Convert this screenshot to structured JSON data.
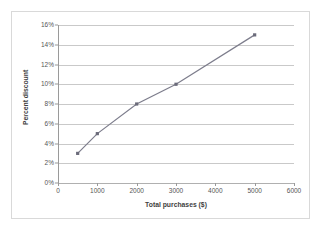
{
  "chart_data": {
    "type": "line",
    "title": "",
    "xlabel": "Total purchases ($)",
    "ylabel": "Percent discount",
    "x": [
      500,
      1000,
      2000,
      3000,
      5000
    ],
    "values": [
      3,
      5,
      8,
      10,
      15
    ],
    "point_labels": [
      "3%",
      "5%",
      "8%",
      "10%",
      "15%"
    ],
    "xlim": [
      0,
      6000
    ],
    "ylim": [
      0,
      16
    ],
    "xticks": [
      0,
      1000,
      2000,
      3000,
      4000,
      5000,
      6000
    ],
    "xtick_labels": [
      "0",
      "1000",
      "2000",
      "3000",
      "4000",
      "5000",
      "6000"
    ],
    "yticks": [
      0,
      2,
      4,
      6,
      8,
      10,
      12,
      14,
      16
    ],
    "ytick_labels": [
      "0%",
      "2%",
      "4%",
      "6%",
      "8%",
      "10%",
      "12%",
      "14%",
      "16%"
    ],
    "grid": "horizontal",
    "legend": "none",
    "series": [
      {
        "name": "Percent discount",
        "values": [
          3,
          5,
          8,
          10,
          15
        ],
        "marker": "square",
        "line_color": "#7d7d8c",
        "marker_color": "#6b6b7a"
      }
    ]
  },
  "style": {
    "line_color": "#7d7d8c",
    "marker_color": "#6b6b7a",
    "gridline_color": "#c9c9c9",
    "axis_color": "#9a9a9a",
    "border_color": "#d9d9d9",
    "background": "#ffffff",
    "tick_text_color": "#555555",
    "title_text_color": "#3f3f3f"
  }
}
